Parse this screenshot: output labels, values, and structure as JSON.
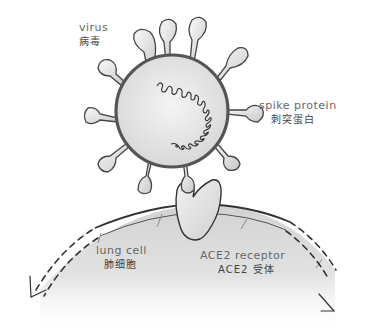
{
  "diagram": {
    "title": "",
    "labels": {
      "virus": {
        "en": "virus",
        "zh": "病毒"
      },
      "spike_protein": {
        "en": "spike protein",
        "zh": "刺突蛋白"
      },
      "lung_cell": {
        "en": "lung cell",
        "zh": "肺细胞"
      },
      "ace2_receptor": {
        "en": "ACE2 receptor",
        "zh": "ACE2 受体"
      }
    },
    "elements": {
      "virus_particle": {
        "shape": "circle",
        "fill": "#e6e6e6",
        "stroke": "#555555",
        "spike_count": 11
      },
      "rna_coil": {
        "shape": "helix",
        "stroke": "#333333"
      },
      "ace2_receptor": {
        "shape": "heart-like blob",
        "fill": "#e8e8e8",
        "stroke": "#333333"
      },
      "lung_cell": {
        "shape": "large arc",
        "fill": "#dcdcdc",
        "membrane_stroke": "#333333"
      },
      "motion_arrows": {
        "count": 2,
        "style": "dashed",
        "directions": [
          "down-left",
          "down-right"
        ]
      }
    },
    "colors": {
      "background": "#ffffff",
      "ink": "#333333",
      "virus_fill": "#e6e6e6",
      "cell_fill": "#dcdcdc"
    }
  }
}
